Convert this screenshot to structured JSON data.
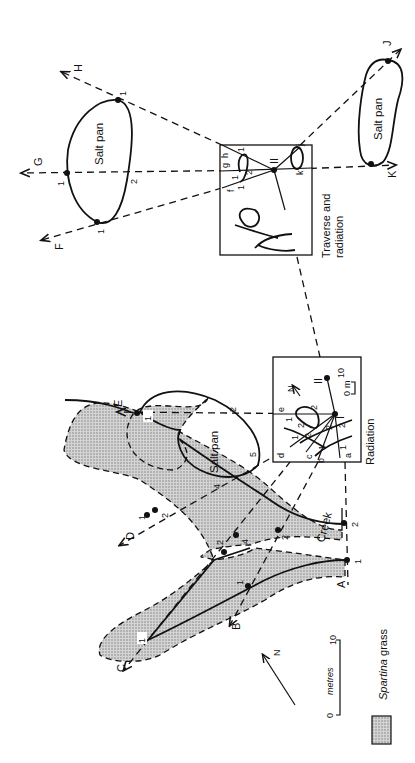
{
  "figure": {
    "orientation": "rotated 90 degrees counter-clockwise",
    "stations": {
      "roman_one": "I",
      "roman_two": "II"
    },
    "boxes": {
      "radiation": {
        "caption": "Radiation",
        "scale_zero": "0",
        "scale_unit": "m",
        "scale_ten": "10",
        "north": "N"
      },
      "traverse": {
        "caption_line1": "Traverse and",
        "caption_line2": "radiation"
      }
    },
    "features": {
      "salt_pan_top": "Salt pan",
      "salt_pan_right": "Salt pan",
      "salt_pan_creek": "Salt pan",
      "creek": "Creek"
    },
    "ray_labels": {
      "A": "A",
      "B": "B",
      "C": "C",
      "D": "D",
      "E": "E",
      "F": "F",
      "G": "G",
      "H": "H",
      "J": "J",
      "K": "K"
    },
    "small_labels": {
      "a": "a",
      "b": "b",
      "c": "c",
      "d": "d",
      "e": "e",
      "f": "f",
      "g": "g",
      "h": "h",
      "j": "j",
      "k": "k"
    },
    "point_numbers": {
      "one": "1",
      "two": "2",
      "four": "4",
      "five": "5"
    },
    "scale": {
      "zero": "0",
      "unit": "metres",
      "ten": "10"
    },
    "north_arrow": "N",
    "legend": {
      "label_italic": "Spartina",
      "label_rest": " grass",
      "swatch_color": "#bdbdbd"
    }
  }
}
